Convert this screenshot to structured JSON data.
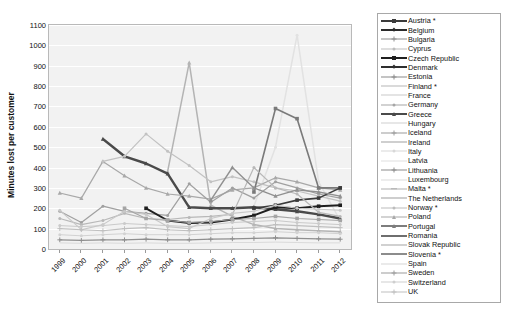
{
  "chart_data": {
    "type": "line",
    "title": "",
    "xlabel": "",
    "ylabel": "Minutes lost per customer",
    "x": [
      "1999",
      "2000",
      "2001",
      "2002",
      "2003",
      "2004",
      "2005",
      "2006",
      "2007",
      "2008",
      "2009",
      "2010",
      "2011",
      "2012"
    ],
    "ylim": [
      0,
      1100
    ],
    "yticks": [
      0,
      100,
      200,
      300,
      400,
      500,
      600,
      700,
      800,
      900,
      1000,
      1100
    ],
    "grid": "horizontal",
    "legend_position": "right",
    "series": [
      {
        "name": "Austria *",
        "color": "#3b3b3b",
        "marker": "square",
        "width": 1.6,
        "values": [
          null,
          null,
          null,
          null,
          null,
          null,
          null,
          null,
          null,
          200,
          215,
          240,
          250,
          300
        ]
      },
      {
        "name": "Belgium",
        "color": "#2b2b2b",
        "marker": "diamond",
        "width": 1.5,
        "values": [
          null,
          null,
          null,
          null,
          null,
          null,
          null,
          null,
          null,
          null,
          null,
          null,
          null,
          null
        ]
      },
      {
        "name": "Bulgaria",
        "color": "#8f8f8f",
        "marker": "plus",
        "width": 1.1,
        "values": [
          null,
          null,
          null,
          null,
          null,
          null,
          null,
          null,
          null,
          null,
          null,
          null,
          null,
          null
        ]
      },
      {
        "name": "Cyprus",
        "color": "#bdbdbd",
        "marker": "dot",
        "width": 1.0,
        "values": [
          null,
          null,
          null,
          null,
          null,
          null,
          null,
          null,
          null,
          null,
          null,
          null,
          null,
          null
        ]
      },
      {
        "name": "Czech Republic",
        "color": "#1f1f1f",
        "marker": "square",
        "width": 2.0,
        "values": [
          null,
          null,
          null,
          null,
          200,
          140,
          128,
          130,
          145,
          165,
          205,
          200,
          210,
          215
        ]
      },
      {
        "name": "Denmark",
        "color": "#2f2f2f",
        "marker": "diamond",
        "width": 1.6,
        "values": [
          null,
          null,
          null,
          null,
          null,
          null,
          null,
          null,
          null,
          null,
          null,
          null,
          null,
          null
        ]
      },
      {
        "name": "Estonia",
        "color": "#8a8a8a",
        "marker": "plus",
        "width": 1.2,
        "values": [
          null,
          null,
          null,
          null,
          null,
          null,
          null,
          null,
          null,
          null,
          null,
          null,
          null,
          null
        ]
      },
      {
        "name": "Finland *",
        "color": "#b5b5b5",
        "marker": "none",
        "width": 1.1,
        "values": [
          null,
          null,
          null,
          null,
          null,
          null,
          null,
          null,
          null,
          null,
          null,
          null,
          null,
          null
        ]
      },
      {
        "name": "France",
        "color": "#c9c9c9",
        "marker": "none",
        "width": 1.0,
        "values": [
          null,
          null,
          null,
          null,
          null,
          null,
          null,
          null,
          null,
          null,
          null,
          null,
          null,
          null
        ]
      },
      {
        "name": "Germany",
        "color": "#a6a6a6",
        "marker": "dot",
        "width": 1.0,
        "values": [
          null,
          null,
          null,
          null,
          null,
          null,
          null,
          null,
          null,
          null,
          null,
          null,
          null,
          null
        ]
      },
      {
        "name": "Greece",
        "color": "#4a4a4a",
        "marker": "triangle",
        "width": 2.4,
        "values": [
          null,
          null,
          540,
          455,
          420,
          370,
          205,
          200,
          200,
          205,
          195,
          185,
          170,
          150
        ]
      },
      {
        "name": "Hungary",
        "color": "#d0d0d0",
        "marker": "none",
        "width": 1.0,
        "values": [
          null,
          null,
          null,
          null,
          null,
          null,
          null,
          null,
          null,
          null,
          null,
          null,
          null,
          null
        ]
      },
      {
        "name": "Iceland",
        "color": "#9b9b9b",
        "marker": "plus",
        "width": 1.2,
        "values": [
          null,
          null,
          null,
          null,
          null,
          null,
          null,
          null,
          null,
          null,
          null,
          null,
          null,
          null
        ]
      },
      {
        "name": "Ireland",
        "color": "#9f9f9f",
        "marker": "none",
        "width": 1.2,
        "values": [
          null,
          null,
          null,
          null,
          null,
          null,
          null,
          null,
          null,
          null,
          null,
          null,
          null,
          null
        ]
      },
      {
        "name": "Italy",
        "color": "#d8d8d8",
        "marker": "dot",
        "width": 1.0,
        "values": [
          null,
          null,
          null,
          null,
          null,
          null,
          null,
          null,
          null,
          null,
          null,
          null,
          null,
          null
        ]
      },
      {
        "name": "Latvia",
        "color": "#e0e0e0",
        "marker": "none",
        "width": 1.0,
        "values": [
          null,
          null,
          null,
          null,
          null,
          null,
          null,
          null,
          null,
          null,
          null,
          null,
          null,
          null
        ]
      },
      {
        "name": "Lithuania",
        "color": "#8b8b8b",
        "marker": "plus",
        "width": 1.4,
        "values": [
          null,
          null,
          null,
          null,
          null,
          null,
          null,
          null,
          null,
          null,
          null,
          null,
          null,
          null
        ]
      },
      {
        "name": "Luxembourg",
        "color": "#dcdcdc",
        "marker": "none",
        "width": 1.0,
        "values": [
          null,
          null,
          null,
          null,
          null,
          null,
          null,
          null,
          null,
          null,
          null,
          null,
          null,
          null
        ]
      },
      {
        "name": "Malta *",
        "color": "#b0b0b0",
        "marker": "dash",
        "width": 1.2,
        "values": [
          null,
          null,
          null,
          null,
          null,
          null,
          null,
          null,
          null,
          null,
          null,
          null,
          null,
          null
        ]
      },
      {
        "name": "The Netherlands",
        "color": "#9e9e9e",
        "marker": "none",
        "width": 1.4,
        "values": [
          null,
          null,
          null,
          null,
          null,
          null,
          null,
          null,
          null,
          null,
          null,
          null,
          null,
          null
        ]
      },
      {
        "name": "Norway *",
        "color": "#bcbcbc",
        "marker": "dot",
        "width": 1.1,
        "values": [
          null,
          null,
          null,
          null,
          null,
          null,
          null,
          null,
          null,
          null,
          null,
          null,
          null,
          null
        ]
      },
      {
        "name": "Poland",
        "color": "#a8a8a8",
        "marker": "triangle",
        "width": 1.1,
        "values": [
          275,
          250,
          430,
          360,
          300,
          270,
          260,
          245,
          290,
          300,
          350,
          330,
          300,
          290
        ]
      },
      {
        "name": "Portugal",
        "color": "#7d7d7d",
        "marker": "triangle",
        "width": 1.8,
        "values": [
          null,
          null,
          null,
          null,
          null,
          null,
          null,
          null,
          null,
          null,
          null,
          null,
          null,
          null
        ]
      },
      {
        "name": "Romania",
        "color": "#6e6e6e",
        "marker": "none",
        "width": 2.0,
        "values": [
          null,
          null,
          null,
          null,
          null,
          null,
          null,
          null,
          null,
          null,
          null,
          null,
          null,
          null
        ]
      },
      {
        "name": "Slovak Republic",
        "color": "#a3a3a3",
        "marker": "none",
        "width": 1.4,
        "values": [
          null,
          null,
          null,
          null,
          null,
          null,
          null,
          null,
          null,
          null,
          null,
          null,
          null,
          null
        ]
      },
      {
        "name": "Slovenia *",
        "color": "#8c8c8c",
        "marker": "none",
        "width": 1.6,
        "values": [
          null,
          null,
          null,
          null,
          null,
          null,
          null,
          null,
          null,
          null,
          null,
          null,
          null,
          null
        ]
      },
      {
        "name": "Spain",
        "color": "#d5d5d5",
        "marker": "none",
        "width": 1.0,
        "values": [
          null,
          null,
          null,
          null,
          null,
          null,
          null,
          null,
          null,
          null,
          null,
          null,
          null,
          null
        ]
      },
      {
        "name": "Sweden",
        "color": "#9c9c9c",
        "marker": "plus",
        "width": 1.2,
        "values": [
          null,
          null,
          null,
          null,
          null,
          null,
          null,
          null,
          null,
          null,
          null,
          null,
          null,
          null
        ]
      },
      {
        "name": "Switzerland",
        "color": "#cfcfcf",
        "marker": "dot",
        "width": 1.0,
        "values": [
          null,
          null,
          null,
          null,
          null,
          null,
          null,
          null,
          null,
          null,
          null,
          null,
          null,
          null
        ]
      },
      {
        "name": "UK",
        "color": "#bfbfbf",
        "marker": "plus",
        "width": 1.1,
        "values": [
          null,
          null,
          null,
          null,
          null,
          null,
          null,
          null,
          null,
          null,
          null,
          null,
          null,
          null
        ]
      }
    ],
    "plot_lines": [
      {
        "name": "line-spike-2005",
        "color": "#b4b4b4",
        "width": 1.5,
        "marker": "triangle",
        "values": [
          null,
          null,
          null,
          null,
          null,
          380,
          915,
          215,
          160,
          120,
          100,
          95,
          90,
          85
        ]
      },
      {
        "name": "line-spike-2010",
        "color": "#e2e2e2",
        "width": 1.5,
        "marker": "dot",
        "values": [
          null,
          null,
          null,
          null,
          null,
          null,
          null,
          null,
          null,
          210,
          500,
          1050,
          330,
          140
        ]
      },
      {
        "name": "line-greece-dark",
        "color": "#4a4a4a",
        "width": 2.4,
        "marker": "triangle",
        "values": [
          null,
          null,
          540,
          455,
          420,
          370,
          205,
          200,
          200,
          205,
          195,
          185,
          170,
          150
        ]
      },
      {
        "name": "line-poland",
        "color": "#a8a8a8",
        "width": 1.2,
        "marker": "triangle",
        "values": [
          275,
          250,
          430,
          360,
          300,
          270,
          260,
          245,
          290,
          300,
          350,
          330,
          300,
          290
        ]
      },
      {
        "name": "line-peak-2003",
        "color": "#c2c2c2",
        "width": 1.2,
        "marker": "dot",
        "values": [
          null,
          null,
          430,
          455,
          565,
          480,
          410,
          330,
          355,
          330,
          300,
          285,
          260,
          235
        ]
      },
      {
        "name": "line-midgray-a",
        "color": "#a0a0a0",
        "width": 1.2,
        "marker": "dot",
        "values": [
          185,
          130,
          210,
          185,
          175,
          165,
          320,
          230,
          300,
          250,
          330,
          300,
          270,
          250
        ]
      },
      {
        "name": "line-2009-rise",
        "color": "#7a7a7a",
        "width": 1.6,
        "marker": "square",
        "values": [
          null,
          null,
          null,
          null,
          null,
          null,
          null,
          null,
          null,
          280,
          690,
          640,
          300,
          300
        ]
      },
      {
        "name": "line-czech",
        "color": "#1f1f1f",
        "width": 2.0,
        "marker": "square",
        "values": [
          null,
          null,
          null,
          null,
          200,
          140,
          128,
          130,
          145,
          165,
          205,
          200,
          210,
          215
        ]
      },
      {
        "name": "line-austria",
        "color": "#3b3b3b",
        "width": 1.6,
        "marker": "square",
        "values": [
          null,
          null,
          null,
          null,
          null,
          null,
          null,
          null,
          null,
          200,
          215,
          240,
          250,
          300
        ]
      },
      {
        "name": "line-mid-b",
        "color": "#b8b8b8",
        "width": 1.2,
        "marker": "dot",
        "values": [
          150,
          120,
          140,
          175,
          150,
          145,
          155,
          160,
          170,
          400,
          300,
          270,
          180,
          160
        ]
      },
      {
        "name": "line-mid-c",
        "color": "#909090",
        "width": 1.4,
        "marker": "triangle",
        "values": [
          null,
          null,
          null,
          null,
          null,
          null,
          null,
          240,
          400,
          300,
          260,
          290,
          280,
          260
        ]
      },
      {
        "name": "line-mid-d",
        "color": "#c8c8c8",
        "width": 1.1,
        "marker": "dot",
        "values": [
          190,
          95,
          120,
          185,
          170,
          110,
          100,
          150,
          175,
          185,
          215,
          200,
          195,
          190
        ]
      },
      {
        "name": "line-low-a",
        "color": "#bfbfbf",
        "width": 1.1,
        "marker": "plus",
        "values": [
          100,
          95,
          90,
          100,
          105,
          95,
          90,
          95,
          100,
          105,
          120,
          115,
          110,
          105
        ]
      },
      {
        "name": "line-low-b",
        "color": "#d2d2d2",
        "width": 1.0,
        "marker": "dot",
        "values": [
          70,
          65,
          70,
          75,
          70,
          70,
          70,
          75,
          80,
          80,
          85,
          80,
          80,
          75
        ]
      },
      {
        "name": "line-low-c",
        "color": "#8f8f8f",
        "width": 1.2,
        "marker": "plus",
        "values": [
          45,
          42,
          45,
          45,
          48,
          45,
          45,
          48,
          50,
          52,
          55,
          52,
          50,
          48
        ]
      },
      {
        "name": "line-low-d",
        "color": "#dadada",
        "width": 1.0,
        "marker": "none",
        "values": [
          30,
          28,
          30,
          28,
          30,
          28,
          28,
          30,
          32,
          32,
          34,
          32,
          30,
          30
        ]
      },
      {
        "name": "line-low-e",
        "color": "#a5a5a5",
        "width": 1.2,
        "marker": "square",
        "values": [
          null,
          null,
          null,
          200,
          150,
          140,
          130,
          135,
          145,
          150,
          160,
          150,
          145,
          140
        ]
      },
      {
        "name": "line-low-f",
        "color": "#cacaca",
        "width": 1.0,
        "marker": "dot",
        "values": [
          115,
          110,
          115,
          125,
          120,
          115,
          110,
          120,
          130,
          135,
          140,
          130,
          125,
          120
        ]
      }
    ]
  }
}
